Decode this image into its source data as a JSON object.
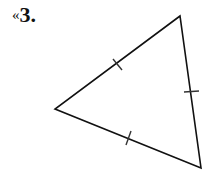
{
  "problem": {
    "marker": "«",
    "number": "3."
  },
  "figure": {
    "shape": "equilateral-triangle",
    "vertices": {
      "top": [
        180,
        16
      ],
      "left": [
        55,
        109
      ],
      "bottom": [
        201,
        168
      ]
    },
    "tick_marks_per_side": 1,
    "stroke_color": "#111111",
    "tick_color": "#333333"
  }
}
